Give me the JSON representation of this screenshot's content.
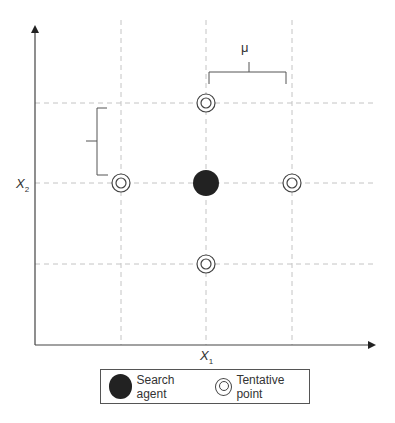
{
  "diagram": {
    "axes": {
      "x_label": "X",
      "x_sub": "1",
      "y_label": "X",
      "y_sub": "2"
    },
    "step_label": "μ",
    "grid": {
      "columns": [
        121,
        206,
        292
      ],
      "rows": [
        103,
        183,
        264
      ]
    },
    "search_agent": {
      "x": 206,
      "y": 183,
      "color": "#222222"
    },
    "tentative_points": [
      {
        "x": 206,
        "y": 103
      },
      {
        "x": 121,
        "y": 183
      },
      {
        "x": 292,
        "y": 183
      },
      {
        "x": 206,
        "y": 264
      }
    ],
    "legend": {
      "search_agent_label": "Search agent",
      "tentative_point_label": "Tentative point"
    },
    "colors": {
      "axis": "#333333",
      "grid": "#bbbbbb",
      "agent": "#222222"
    }
  }
}
